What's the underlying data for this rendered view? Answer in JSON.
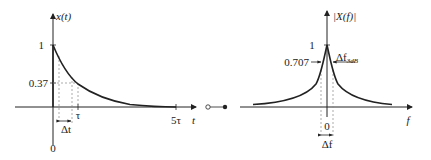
{
  "left_plot": {
    "y_axis_label": "x(t)",
    "x_axis_label": "t",
    "y_tick_1": "1",
    "y_tick_037": "0.37",
    "origin_label": "0",
    "x_tick_tau": "τ",
    "x_tick_5tau": "5τ",
    "delta_label": "Δt",
    "curve": "exponential decay x(t) = e^(-t/τ)"
  },
  "connector": {
    "symbol": "transform pair (○—●)"
  },
  "right_plot": {
    "y_axis_label": "|X(f)|",
    "x_axis_label": "f",
    "y_tick_1": "1",
    "y_tick_0707": "0.707",
    "origin_label": "0",
    "bandwidth_label_main": "Δf",
    "bandwidth_label_sub": "3dB",
    "delta_label": "Δf",
    "curve": "Lorentzian magnitude spectrum"
  },
  "colors": {
    "line": "#222222",
    "dashed": "#888888",
    "background": "#ffffff"
  }
}
